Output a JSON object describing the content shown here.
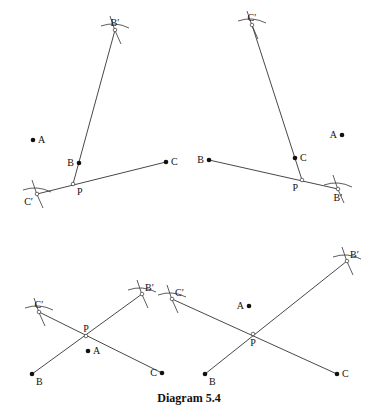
{
  "caption": "Diagram 5.4",
  "panels": [
    {
      "id": "top-left",
      "points": {
        "A": {
          "label": "A",
          "kind": "dot",
          "x": 33,
          "y": 140,
          "label_side": "right"
        },
        "B": {
          "label": "B",
          "kind": "dot",
          "x": 79,
          "y": 163,
          "label_side": "left"
        },
        "C": {
          "label": "C",
          "kind": "dot",
          "x": 166,
          "y": 162,
          "label_side": "right"
        },
        "P": {
          "label": "P",
          "kind": "open",
          "x": 73,
          "y": 184,
          "label_side": "below-right"
        },
        "B'": {
          "label": "B′",
          "kind": "open",
          "x": 115,
          "y": 30,
          "label_side": "above"
        },
        "C'": {
          "label": "C′",
          "kind": "open",
          "x": 37,
          "y": 194,
          "label_side": "below-left"
        }
      },
      "segments": [
        [
          "P",
          "B'"
        ],
        [
          "C'",
          "C"
        ]
      ],
      "arc_points": [
        "B'",
        "C'"
      ]
    },
    {
      "id": "top-right",
      "points": {
        "A": {
          "label": "A",
          "kind": "dot",
          "x": 342,
          "y": 135,
          "label_side": "left"
        },
        "B": {
          "label": "B",
          "kind": "dot",
          "x": 209,
          "y": 160,
          "label_side": "left"
        },
        "C": {
          "label": "C",
          "kind": "dot",
          "x": 295,
          "y": 158,
          "label_side": "right"
        },
        "P": {
          "label": "P",
          "kind": "open",
          "x": 302,
          "y": 180,
          "label_side": "below-left"
        },
        "B'": {
          "label": "B′",
          "kind": "open",
          "x": 338,
          "y": 189,
          "label_side": "below"
        },
        "C'": {
          "label": "C′",
          "kind": "open",
          "x": 252,
          "y": 25,
          "label_side": "above"
        }
      },
      "segments": [
        [
          "P",
          "C'"
        ],
        [
          "B",
          "B'"
        ]
      ],
      "arc_points": [
        "B'",
        "C'"
      ]
    },
    {
      "id": "bottom-left",
      "points": {
        "A": {
          "label": "A",
          "kind": "dot",
          "x": 88,
          "y": 351,
          "label_side": "right"
        },
        "B": {
          "label": "B",
          "kind": "dot",
          "x": 32,
          "y": 374,
          "label_side": "below-right"
        },
        "C": {
          "label": "C",
          "kind": "dot",
          "x": 162,
          "y": 373,
          "label_side": "left"
        },
        "P": {
          "label": "P",
          "kind": "open",
          "x": 86,
          "y": 336,
          "label_side": "above"
        },
        "B'": {
          "label": "B′",
          "kind": "open",
          "x": 142,
          "y": 294,
          "label_side": "above-right"
        },
        "C'": {
          "label": "C′",
          "kind": "open",
          "x": 39,
          "y": 312,
          "label_side": "above"
        }
      },
      "segments": [
        [
          "B",
          "B'"
        ],
        [
          "C'",
          "C"
        ]
      ],
      "arc_points": [
        "B'",
        "C'"
      ]
    },
    {
      "id": "bottom-right",
      "points": {
        "A": {
          "label": "A",
          "kind": "dot",
          "x": 249,
          "y": 306,
          "label_side": "left"
        },
        "B": {
          "label": "B",
          "kind": "dot",
          "x": 205,
          "y": 374,
          "label_side": "below-right"
        },
        "C": {
          "label": "C",
          "kind": "dot",
          "x": 337,
          "y": 374,
          "label_side": "right"
        },
        "P": {
          "label": "P",
          "kind": "open",
          "x": 253,
          "y": 334,
          "label_side": "below"
        },
        "B'": {
          "label": "B′",
          "kind": "open",
          "x": 347,
          "y": 261,
          "label_side": "above-right"
        },
        "C'": {
          "label": "C′",
          "kind": "open",
          "x": 172,
          "y": 299,
          "label_side": "above-right"
        }
      },
      "segments": [
        [
          "B",
          "B'"
        ],
        [
          "C'",
          "C"
        ]
      ],
      "arc_points": [
        "B'",
        "C'"
      ]
    }
  ]
}
